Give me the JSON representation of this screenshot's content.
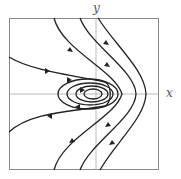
{
  "figure": {
    "type": "phase-portrait",
    "axes": {
      "x_label": "x",
      "y_label": "y"
    },
    "colors": {
      "curve": "#222222",
      "axis": "#999999",
      "frame": "#888888"
    }
  }
}
